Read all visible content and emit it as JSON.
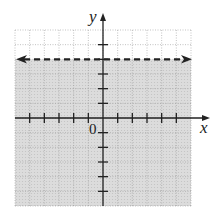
{
  "chart_data": {
    "type": "inequality-graph",
    "title": "",
    "xlabel": "x",
    "ylabel": "y",
    "origin_label": "0",
    "xlim": [
      -6,
      6
    ],
    "ylim": [
      -6,
      6
    ],
    "grid": true,
    "boundary": {
      "equation": "y = 4",
      "style": "dashed",
      "arrows": "both"
    },
    "shaded_region": "y < 4",
    "inequality": "y < 4",
    "colors": {
      "shade": "#d9d9d9",
      "grid": "#aaaaaa",
      "axis": "#222222"
    }
  }
}
